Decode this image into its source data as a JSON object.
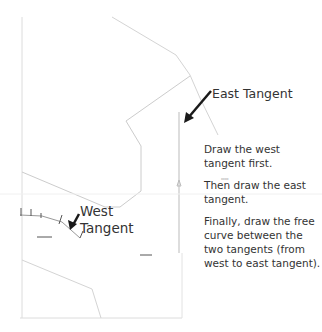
{
  "labels": {
    "east_tangent": "East Tangent",
    "west_tangent_line1": "West",
    "west_tangent_line2": "Tangent"
  },
  "instructions": {
    "step1": "Draw the west tangent first.",
    "step2": "Then draw the east tangent.",
    "step3": "Finally, draw the free curve between the two tangents (from west to east tangent)."
  },
  "colors": {
    "map_line": "#cfcfcf",
    "arrow": "#1a1a1a",
    "text": "#333333"
  }
}
